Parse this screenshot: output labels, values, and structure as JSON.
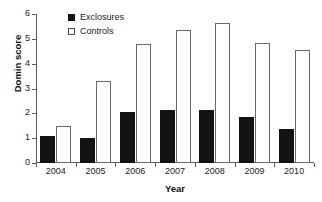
{
  "chart_data": {
    "type": "bar",
    "title": "",
    "xlabel": "Year",
    "ylabel": "Domin score",
    "categories": [
      "2004",
      "2005",
      "2006",
      "2007",
      "2008",
      "2009",
      "2010"
    ],
    "series": [
      {
        "name": "Exclosures",
        "color": "#131313",
        "fill": "solid",
        "values": [
          1.1,
          1.0,
          2.05,
          2.15,
          2.15,
          1.85,
          1.35
        ]
      },
      {
        "name": "Controls",
        "color": "#ffffff",
        "fill": "open",
        "values": [
          1.5,
          3.3,
          4.8,
          5.35,
          5.65,
          4.85,
          4.55
        ]
      }
    ],
    "ylim": [
      0,
      6
    ],
    "yticks": [
      0,
      1,
      2,
      3,
      4,
      5,
      6
    ],
    "ytick_labels": [
      "0",
      "1",
      "2",
      "3",
      "4",
      "5",
      "6"
    ],
    "grid": false,
    "legend_position": "top-left-inside",
    "axis_color": "#5b5b5b"
  },
  "legend": {
    "items": [
      {
        "label": "Exclosures"
      },
      {
        "label": "Controls"
      }
    ]
  }
}
